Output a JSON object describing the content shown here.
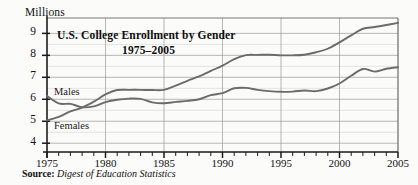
{
  "figure": {
    "unit_label": "Millions",
    "source_prefix": "Source:",
    "source_body": "Digest of Education Statistics"
  },
  "chart_data": {
    "type": "line",
    "title": "U.S. College Enrollment by Gender",
    "subtitle": "1975–2005",
    "title_line1": "U.S. College Enrollment by Gender",
    "title_line2": "1975–2005",
    "xlabel": "",
    "ylabel": "Millions",
    "xlim": [
      1975,
      2005
    ],
    "ylim": [
      3.6,
      9.7
    ],
    "grid": true,
    "legend_position": "inline-labels",
    "ytick_labels": [
      "9",
      "8",
      "7",
      "6",
      "5",
      "4"
    ],
    "yticks": [
      9,
      8,
      7,
      6,
      5,
      4
    ],
    "xtick_labels": [
      "1975",
      "1980",
      "1985",
      "1990",
      "1995",
      "2000",
      "2005"
    ],
    "xticks": [
      1975,
      1980,
      1985,
      1990,
      1995,
      2000,
      2005
    ],
    "x": [
      1975,
      1976,
      1977,
      1978,
      1979,
      1980,
      1981,
      1982,
      1983,
      1984,
      1985,
      1986,
      1987,
      1988,
      1989,
      1990,
      1991,
      1992,
      1993,
      1994,
      1995,
      1996,
      1997,
      1998,
      1999,
      2000,
      2001,
      2002,
      2003,
      2004,
      2005
    ],
    "series": [
      {
        "name": "Males",
        "label": "Males",
        "color": "#6b6b6b",
        "values": [
          6.15,
          5.81,
          5.79,
          5.64,
          5.68,
          5.87,
          5.98,
          6.03,
          6.02,
          5.86,
          5.82,
          5.88,
          5.93,
          6.0,
          6.19,
          6.28,
          6.5,
          6.52,
          6.43,
          6.37,
          6.34,
          6.35,
          6.4,
          6.37,
          6.49,
          6.72,
          7.07,
          7.38,
          7.26,
          7.39,
          7.46
        ],
        "endpoint_value": 7.46
      },
      {
        "name": "Females",
        "label": "Females",
        "color": "#6b6b6b",
        "values": [
          5.04,
          5.2,
          5.45,
          5.62,
          5.89,
          6.22,
          6.42,
          6.43,
          6.43,
          6.42,
          6.43,
          6.62,
          6.84,
          7.04,
          7.29,
          7.53,
          7.83,
          8.01,
          8.02,
          8.03,
          8.0,
          8.0,
          8.03,
          8.14,
          8.3,
          8.59,
          8.91,
          9.21,
          9.29,
          9.38,
          9.48
        ],
        "endpoint_value": 9.48
      }
    ],
    "annotations": [
      {
        "text": "Males",
        "x": 1976.5,
        "y": 6.6
      },
      {
        "text": "Females",
        "x": 1976.5,
        "y": 4.85
      }
    ]
  }
}
